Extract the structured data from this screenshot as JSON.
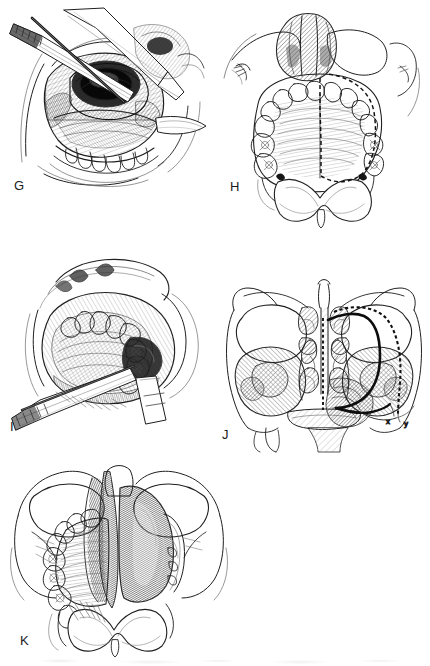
{
  "figure": {
    "type": "surgical-atlas-plate",
    "style": "pen-and-ink medical illustration",
    "background_color": "#ffffff",
    "ink_color": "#1a1a1a",
    "panel_count": 5,
    "panel_letters": [
      "G",
      "H",
      "I",
      "J",
      "K"
    ]
  },
  "panels": [
    {
      "letter": "G",
      "label": "G",
      "view": "intraoral surgical exposure, upper jaw, retracted",
      "description": "Operative view of the oral cavity with lip and cheek retracted; osteotome and retractor instruments in the surgical field exposing the maxilla and hard palate; lower teeth visible below.",
      "contents": [
        "osteotome",
        "retractor",
        "maxilla",
        "hard palate",
        "teeth",
        "soft tissue flap"
      ]
    },
    {
      "letter": "H",
      "label": "H",
      "view": "inferior view of maxilla and hard palate",
      "description": "Hard palate seen from below with full dental arch; dashed line marks the planned midline palatal and lateral resection incision around the right hemipalate; nasal tip and columella shown above with cross-hatching.",
      "contents": [
        "hard palate",
        "maxillary dental arch",
        "nasal tip",
        "columella",
        "soft palate",
        "uvula",
        "dashed incision line"
      ],
      "markings": [
        {
          "kind": "dashed-line",
          "meaning": "planned resection / incision line"
        }
      ]
    },
    {
      "letter": "I",
      "label": "I",
      "view": "intraoral surgical exposure with retractors",
      "description": "Operative view showing the mobilized palatal segment with upper teeth; cheek retractor superiorly and double-ended retractor inferiorly holding the field open.",
      "contents": [
        "retractor",
        "maxillary teeth",
        "palatal mucosa",
        "soft tissue flap",
        "surgical field"
      ]
    },
    {
      "letter": "J",
      "label": "J",
      "view": "coronal cross-section of midface",
      "description": "Coronal section through the midface showing both orbits, ethmoid air cells, nasal septum, inferior and middle turbinates, and both maxillary sinuses with hatched shading; a bold solid line and an adjacent dashed line mark two alternative resection extents, their lateral ends labelled x and y.",
      "contents": [
        "orbit",
        "ethmoid air cells",
        "nasal septum",
        "middle turbinate",
        "inferior turbinate",
        "maxillary sinus",
        "hard palate",
        "zygoma"
      ],
      "markings": [
        {
          "kind": "solid-line",
          "meaning": "resection margin",
          "endpoint_label": "x"
        },
        {
          "kind": "dashed-line",
          "meaning": "extended resection margin",
          "endpoint_label": "y"
        }
      ],
      "sublabels": [
        "x",
        "y"
      ]
    },
    {
      "letter": "K",
      "label": "K",
      "view": "inferior view after resection",
      "description": "Hard palate from below after right partial maxillectomy; the resected defect exposes the dark nasal cavity and maxillary antrum on the right, with remaining left dental arch, soft palate and uvula intact.",
      "contents": [
        "surgical defect",
        "nasal cavity",
        "maxillary antrum",
        "remaining dental arch",
        "soft palate",
        "uvula",
        "nasal septum"
      ]
    }
  ],
  "palette": {
    "ink": "#1a1a1a",
    "line": "#2b2b2b",
    "hatch_light": "#b9b9b9",
    "hatch_mid": "#8d8d8d",
    "hatch_dark": "#4a4a4a",
    "shadow": "#5e5e5e",
    "paper": "#ffffff"
  }
}
